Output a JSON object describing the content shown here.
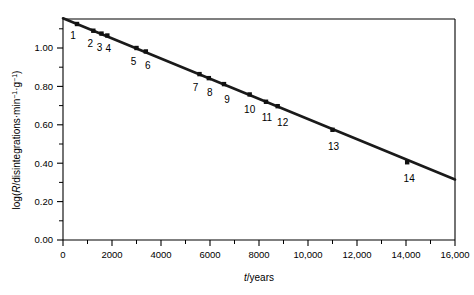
{
  "chart_data": {
    "type": "scatter",
    "title": "",
    "xlabel": "t/years",
    "ylabel": "log(R/disintegrations·min⁻¹·g⁻¹)",
    "xlim": [
      0,
      16800
    ],
    "ylim": [
      0.0,
      1.2
    ],
    "grid": false,
    "legend": null,
    "xticks": [
      0,
      2000,
      4000,
      6000,
      8000,
      10000,
      12000,
      14000,
      16000
    ],
    "xticklabels": [
      "0",
      "2000",
      "4000",
      "6000",
      "8000",
      "10,000",
      "12,000",
      "14,000",
      "16,000"
    ],
    "yticks": [
      0.0,
      0.2,
      0.4,
      0.6,
      0.8,
      1.0
    ],
    "yticklabels": [
      "0.00",
      "0.20",
      "0.40",
      "0.60",
      "0.80",
      "1.00"
    ],
    "x_minor_ticks": [
      1000,
      3000,
      5000,
      7000,
      9000,
      11000,
      13000,
      15000
    ],
    "y_minor_ticks": [
      0.1,
      0.3,
      0.5,
      0.7,
      0.9,
      1.1
    ],
    "point_labels": [
      "1",
      "2",
      "3",
      "4",
      "5",
      "6",
      "7",
      "8",
      "9",
      "10",
      "11",
      "12",
      "13",
      "14"
    ],
    "x": [
      600,
      1300,
      1650,
      1900,
      3150,
      3550,
      5850,
      6250,
      6900,
      8000,
      8700,
      9200,
      11550,
      14750
    ],
    "y": [
      1.125,
      1.09,
      1.075,
      1.065,
      1.0,
      0.982,
      0.864,
      0.843,
      0.812,
      0.758,
      0.72,
      0.697,
      0.574,
      0.405
    ],
    "line": {
      "x0": 0,
      "y0": 1.155,
      "x1": 16800,
      "y1": 0.315
    },
    "marker": "square",
    "marker_color": "#111111",
    "line_color": "#1a1a1a"
  },
  "axes": {
    "x_title_var": "t",
    "x_title_rest": "/years",
    "y_title_prefix": "log(",
    "y_title_var": "R",
    "y_title_rest": "/disintegrations·min",
    "y_title_sup1": "−1",
    "y_title_mid": "·g",
    "y_title_sup2": "−1",
    "y_title_suffix": ")"
  }
}
